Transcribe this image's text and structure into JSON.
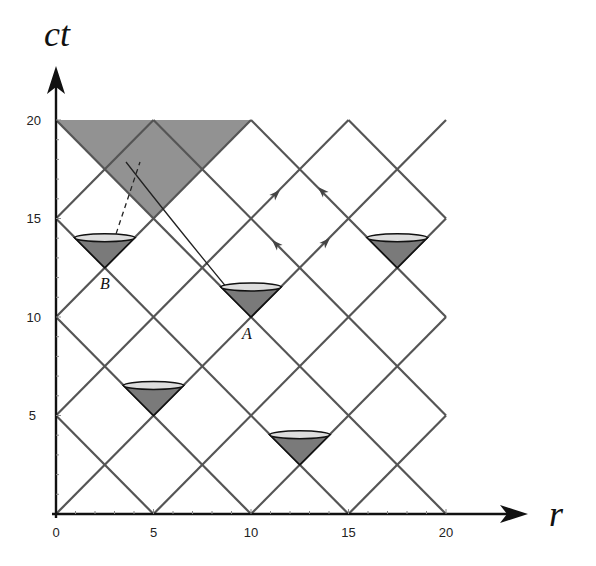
{
  "figure": {
    "x_axis_label": "r",
    "y_axis_label": "ct",
    "x_ticks": [
      "0",
      "5",
      "10",
      "15",
      "20"
    ],
    "y_ticks": [
      "5",
      "10",
      "15",
      "20"
    ],
    "points": [
      {
        "label": "A",
        "r": 10,
        "ct": 10
      },
      {
        "label": "B",
        "r": 2.5,
        "ct": 12.5
      }
    ],
    "light_cones": [
      {
        "r": 2.5,
        "ct": 12.5
      },
      {
        "r": 10,
        "ct": 10
      },
      {
        "r": 17.5,
        "ct": 12.5
      },
      {
        "r": 5,
        "ct": 5
      },
      {
        "r": 12.5,
        "ct": 2.5
      }
    ],
    "shaded_region": {
      "vertices": [
        [
          0,
          20
        ],
        [
          10,
          20
        ],
        [
          5,
          15
        ]
      ]
    },
    "colors": {
      "grid": "#555555",
      "shade": "#8c8c8c",
      "cone_fill": "#7a7a7a",
      "cone_top": "#dddddd"
    }
  },
  "chart_data": {
    "type": "diagram",
    "title": "",
    "xlabel": "r",
    "ylabel": "ct",
    "xlim": [
      0,
      20
    ],
    "ylim": [
      0,
      20
    ],
    "null_lines_slope_plus1_intercepts": [
      -15,
      -10,
      -5,
      0,
      5,
      10,
      15
    ],
    "null_lines_slope_minus1_intercepts": [
      5,
      10,
      15,
      20,
      25,
      30,
      35
    ],
    "light_cone_apexes": [
      [
        2.5,
        12.5
      ],
      [
        10,
        10
      ],
      [
        17.5,
        12.5
      ],
      [
        5,
        5
      ],
      [
        12.5,
        2.5
      ]
    ],
    "labeled_events": {
      "A": [
        10,
        10
      ],
      "B": [
        2.5,
        12.5
      ]
    },
    "worldlines": [
      {
        "from": [
          10,
          10
        ],
        "to": [
          3.6,
          18
        ],
        "style": "solid"
      },
      {
        "from": [
          2.5,
          12.5
        ],
        "to": [
          4.3,
          18
        ],
        "style": "dashed"
      }
    ],
    "arrows_on_diamond_centered": [
      12.5,
      15
    ]
  }
}
